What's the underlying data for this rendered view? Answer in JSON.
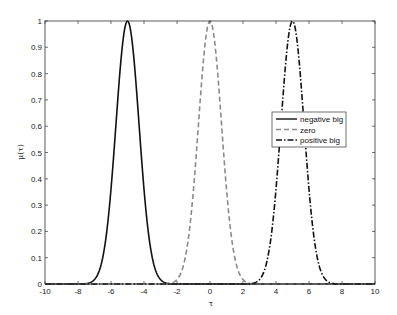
{
  "chart_data": {
    "type": "line",
    "title": "",
    "xlabel": "τ",
    "ylabel": "μ(τ)",
    "xlim": [
      -10,
      10
    ],
    "ylim": [
      0,
      1
    ],
    "grid": false,
    "legend_position": "inside right, upper-middle",
    "xticks": [
      -10,
      -8,
      -6,
      -4,
      -2,
      0,
      2,
      4,
      6,
      8,
      10
    ],
    "xtick_labels": [
      "-10",
      "-8",
      "-6",
      "-4",
      "-2",
      "0",
      "2",
      "4",
      "6",
      "8",
      "10"
    ],
    "yticks": [
      0,
      0.1,
      0.2,
      0.3,
      0.4,
      0.5,
      0.6,
      0.7,
      0.8,
      0.9,
      1
    ],
    "ytick_labels": [
      "0",
      "0.1",
      "0.2",
      "0.3",
      "0.4",
      "0.5",
      "0.6",
      "0.7",
      "0.8",
      "0.9",
      "1"
    ],
    "series": [
      {
        "name": "negative big",
        "shape": "gaussian",
        "center": -5,
        "sigma": 0.7,
        "peak": 1,
        "support": [
          -7.5,
          -2.5
        ],
        "color": "#111111",
        "dash": "solid",
        "x": [
          -10,
          -7.5,
          -7,
          -6.5,
          -6,
          -5.5,
          -5,
          -4.5,
          -4,
          -3.5,
          -3,
          -2.5,
          10
        ],
        "values": [
          0,
          0.002,
          0.017,
          0.1,
          0.36,
          0.77,
          1,
          0.77,
          0.36,
          0.1,
          0.017,
          0.002,
          0
        ]
      },
      {
        "name": "zero",
        "shape": "gaussian",
        "center": 0,
        "sigma": 0.7,
        "peak": 1,
        "support": [
          -2.5,
          2.5
        ],
        "color": "#8a8a8a",
        "dash": "dashed",
        "x": [
          -10,
          -2.5,
          -2,
          -1.5,
          -1,
          -0.5,
          0,
          0.5,
          1,
          1.5,
          2,
          2.5,
          10
        ],
        "values": [
          0,
          0.002,
          0.017,
          0.1,
          0.36,
          0.77,
          1,
          0.77,
          0.36,
          0.1,
          0.017,
          0.002,
          0
        ]
      },
      {
        "name": "positive big",
        "shape": "gaussian",
        "center": 5,
        "sigma": 0.7,
        "peak": 1,
        "support": [
          2.5,
          7.5
        ],
        "color": "#111111",
        "dash": "dash-dot",
        "x": [
          -10,
          2.5,
          3,
          3.5,
          4,
          4.5,
          5,
          5.5,
          6,
          6.5,
          7,
          7.5,
          10
        ],
        "values": [
          0,
          0.002,
          0.017,
          0.1,
          0.36,
          0.77,
          1,
          0.77,
          0.36,
          0.1,
          0.017,
          0.002,
          0
        ]
      }
    ]
  }
}
